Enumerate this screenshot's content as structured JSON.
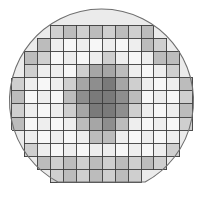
{
  "figure": {
    "name": "wafer-map",
    "type": "wafer-die-map",
    "canvas_width": 203,
    "canvas_height": 207
  },
  "wafer": {
    "center_x": 101.5,
    "center_y": 101.0,
    "radius": 92,
    "flat_y": 182,
    "fill_color": "#ebebeb",
    "outline_color": "#6e6e6e",
    "outline_width": 1.1
  },
  "grid": {
    "columns": 14,
    "rows": 12,
    "origin_x": 11.5,
    "origin_y": 25.0,
    "cell_width": 12.95,
    "cell_height": 13.15,
    "line_color": "#3c3c3c",
    "line_width": 0.9,
    "cell_stroke": "#5a5a5a"
  },
  "legend": {
    "palette_name": "grayscale",
    "levels": [
      {
        "key": "0",
        "label": "empty",
        "color": "none"
      },
      {
        "key": "1",
        "label": "very low",
        "color": "#f7f7f7"
      },
      {
        "key": "2",
        "label": "low",
        "color": "#eeeeee"
      },
      {
        "key": "3",
        "label": "medium low",
        "color": "#e2e2e2"
      },
      {
        "key": "4",
        "label": "medium",
        "color": "#cfcfcf"
      },
      {
        "key": "5",
        "label": "medium high",
        "color": "#bcbcbc"
      },
      {
        "key": "6",
        "label": "high",
        "color": "#a6a6a6"
      },
      {
        "key": "7",
        "label": "very high",
        "color": "#8e8e8e"
      },
      {
        "key": "8",
        "label": "maximum",
        "color": "#7a7a7a"
      }
    ]
  },
  "chart_data": {
    "type": "heatmap",
    "title": "",
    "xlabel": "",
    "ylabel": "",
    "columns": 14,
    "rows": 12,
    "value_min": 0,
    "value_max": 8,
    "colormap": "grayscale",
    "null_value": 0,
    "note": "Row-major matrix of die gray levels; 0 marks positions outside the die footprint.",
    "matrix": [
      [
        0,
        0,
        0,
        4,
        5,
        4,
        5,
        4,
        5,
        4,
        5,
        0,
        0,
        0
      ],
      [
        0,
        0,
        5,
        2,
        1,
        2,
        1,
        2,
        1,
        2,
        5,
        4,
        0,
        0
      ],
      [
        0,
        5,
        4,
        1,
        2,
        1,
        2,
        4,
        2,
        1,
        2,
        5,
        5,
        0
      ],
      [
        0,
        4,
        2,
        2,
        1,
        4,
        6,
        6,
        5,
        2,
        1,
        2,
        4,
        0
      ],
      [
        4,
        2,
        1,
        2,
        4,
        6,
        7,
        8,
        6,
        4,
        2,
        1,
        2,
        5
      ],
      [
        5,
        1,
        2,
        1,
        5,
        7,
        8,
        8,
        7,
        5,
        1,
        2,
        1,
        4
      ],
      [
        4,
        2,
        1,
        2,
        4,
        6,
        8,
        8,
        7,
        4,
        2,
        1,
        2,
        5
      ],
      [
        5,
        1,
        2,
        1,
        2,
        5,
        6,
        7,
        5,
        2,
        1,
        2,
        1,
        4
      ],
      [
        0,
        2,
        1,
        2,
        1,
        2,
        5,
        5,
        2,
        1,
        2,
        1,
        2,
        0
      ],
      [
        0,
        4,
        2,
        1,
        2,
        1,
        2,
        2,
        1,
        2,
        1,
        2,
        4,
        0
      ],
      [
        0,
        0,
        5,
        4,
        5,
        4,
        5,
        4,
        5,
        4,
        5,
        4,
        0,
        0
      ],
      [
        0,
        0,
        0,
        4,
        5,
        4,
        5,
        4,
        5,
        4,
        0,
        0,
        0,
        0
      ]
    ]
  }
}
